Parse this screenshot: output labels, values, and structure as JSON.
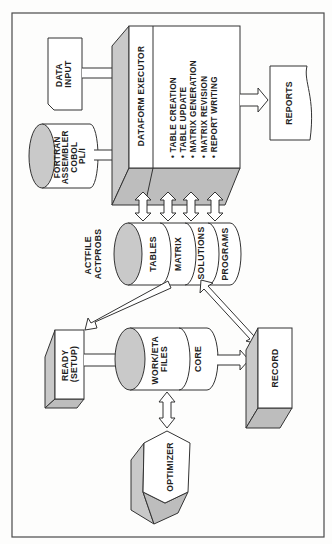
{
  "diagram": {
    "orientation": "rotated-90-ccw",
    "colors": {
      "line": "#333333",
      "shade": "#c9c9c9",
      "shade_dark": "#b8b8b8",
      "fill": "#ffffff",
      "text": "#1e1e1e"
    },
    "nodes": {
      "data_input": {
        "lines": [
          "DATA",
          "INPUT"
        ]
      },
      "languages": {
        "lines": [
          "FORTRAN",
          "ASSEMBLER",
          "COBOL",
          "PL/I"
        ]
      },
      "executor": {
        "title": "DATAFORM EXECUTOR",
        "functions": [
          "• TABLE CREATION",
          "• TABLE UPDATE",
          "• MATRIX GENERATION",
          "• MATRIX REVISION",
          "• REPORT WRITING"
        ]
      },
      "reports": {
        "label": "REPORTS"
      },
      "files_label": {
        "lines": [
          "ACTFILE",
          "ACTPROBS"
        ]
      },
      "file_segments": [
        "TABLES",
        "MATRIX",
        "SOLUTIONS",
        "PROGRAMS"
      ],
      "ready": {
        "lines": [
          "READY",
          "(SETUP)"
        ]
      },
      "work_files": {
        "lines": [
          "WORK/ETA",
          "FILES"
        ]
      },
      "core": {
        "label": "CORE"
      },
      "record": {
        "label": "RECORD"
      },
      "optimizer": {
        "label": "OPTIMIZER"
      }
    },
    "edges": [
      {
        "from": "DATA INPUT",
        "to": "DATAFORM EXECUTOR",
        "type": "single-arrow"
      },
      {
        "from": "FORTRAN/ASSEMBLER/COBOL/PL/I",
        "to": "DATAFORM EXECUTOR",
        "type": "single-arrow"
      },
      {
        "from": "DATAFORM EXECUTOR",
        "to": "REPORTS",
        "type": "single-arrow"
      },
      {
        "from": "DATAFORM EXECUTOR",
        "to": "TABLES",
        "type": "double-arrow"
      },
      {
        "from": "DATAFORM EXECUTOR",
        "to": "MATRIX",
        "type": "double-arrow"
      },
      {
        "from": "DATAFORM EXECUTOR",
        "to": "SOLUTIONS",
        "type": "double-arrow"
      },
      {
        "from": "DATAFORM EXECUTOR",
        "to": "PROGRAMS",
        "type": "double-arrow"
      },
      {
        "from": "MATRIX",
        "to": "READY (SETUP)",
        "type": "single-arrow"
      },
      {
        "from": "READY (SETUP)",
        "to": "WORK/ETA FILES",
        "type": "single-arrow"
      },
      {
        "from": "CORE",
        "to": "RECORD",
        "type": "single-arrow"
      },
      {
        "from": "RECORD",
        "to": "SOLUTIONS",
        "type": "double-arrow"
      },
      {
        "from": "WORK/ETA FILES",
        "to": "OPTIMIZER",
        "type": "double-arrow"
      }
    ]
  }
}
